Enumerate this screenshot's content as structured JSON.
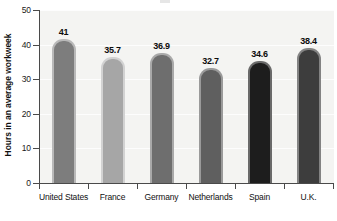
{
  "chart_data": {
    "type": "bar",
    "title": "",
    "xlabel": "",
    "ylabel": "Hours in an average workweek",
    "ylim": [
      0,
      50
    ],
    "yticks": [
      0,
      10,
      20,
      30,
      40,
      50
    ],
    "ytick_labels": [
      "0",
      "10",
      "20",
      "30",
      "40",
      "50"
    ],
    "grid": true,
    "legend": "none",
    "categories": [
      "United States",
      "France",
      "Germany",
      "Netherlands",
      "Spain",
      "U.K."
    ],
    "values": [
      41,
      35.7,
      36.9,
      32.7,
      34.6,
      38.4
    ],
    "value_labels": [
      "41",
      "35.7",
      "36.9",
      "32.7",
      "34.6",
      "38.4"
    ],
    "bar_colors": [
      "#7d7d7d",
      "#a6a6a6",
      "#6e6e6e",
      "#5f5f5f",
      "#1d1d1d",
      "#3d3d3d"
    ],
    "bar_highlight_colors": [
      "#b9b9b9",
      "#d2d2d2",
      "#a9a9a9",
      "#9a9a9a",
      "#6a6a6a",
      "#838383"
    ],
    "plot_background": "#f4f4f2",
    "axis_color": "#4a4a4a",
    "text_color": "#111111"
  }
}
